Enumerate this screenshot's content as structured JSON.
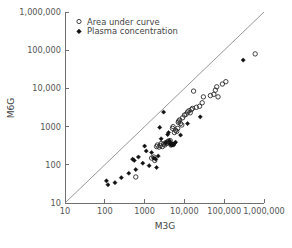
{
  "chart_data": {
    "type": "scatter",
    "title": "",
    "xlabel": "M3G",
    "ylabel": "M6G",
    "xscale": "log",
    "yscale": "log",
    "xlim": [
      10,
      1000000
    ],
    "ylim": [
      10,
      1000000
    ],
    "xticks": [
      10,
      100,
      1000,
      10000,
      100000,
      1000000
    ],
    "yticks": [
      10,
      100,
      1000,
      10000,
      100000,
      1000000
    ],
    "xtick_labels": [
      "10",
      "100",
      "1000",
      "10,000",
      "100,000",
      "1,000,000"
    ],
    "ytick_labels": [
      "10",
      "100",
      "1000",
      "10,000",
      "100,000",
      "1,000,000"
    ],
    "grid": false,
    "legend_position": "top-left",
    "annotations": [
      {
        "name": "identity-line",
        "type": "line",
        "from": [
          10,
          10
        ],
        "to": [
          1000000,
          1000000
        ],
        "label": "line of identity"
      }
    ],
    "series": [
      {
        "name": "Area under curve",
        "marker": "open-circle",
        "color": "#2b2b2b",
        "points": [
          [
            600,
            48
          ],
          [
            1500,
            150
          ],
          [
            1700,
            160
          ],
          [
            1800,
            130
          ],
          [
            2000,
            300
          ],
          [
            2100,
            330
          ],
          [
            2300,
            290
          ],
          [
            2500,
            320
          ],
          [
            2600,
            360
          ],
          [
            2800,
            300
          ],
          [
            3000,
            350
          ],
          [
            3200,
            330
          ],
          [
            3400,
            380
          ],
          [
            3600,
            360
          ],
          [
            3800,
            400
          ],
          [
            4000,
            420
          ],
          [
            4200,
            390
          ],
          [
            4400,
            430
          ],
          [
            4600,
            330
          ],
          [
            4800,
            340
          ],
          [
            5000,
            900
          ],
          [
            5200,
            1000
          ],
          [
            5600,
            700
          ],
          [
            6000,
            800
          ],
          [
            6400,
            750
          ],
          [
            6800,
            900
          ],
          [
            7000,
            1300
          ],
          [
            7200,
            1400
          ],
          [
            7600,
            1500
          ],
          [
            8000,
            1200
          ],
          [
            8600,
            1100
          ],
          [
            9000,
            1700
          ],
          [
            10000,
            2000
          ],
          [
            11000,
            2100
          ],
          [
            12000,
            2400
          ],
          [
            13000,
            2600
          ],
          [
            14000,
            2300
          ],
          [
            15000,
            2800
          ],
          [
            16000,
            3000
          ],
          [
            17000,
            8500
          ],
          [
            20000,
            3200
          ],
          [
            24000,
            3400
          ],
          [
            28000,
            4200
          ],
          [
            30000,
            6000
          ],
          [
            45000,
            6500
          ],
          [
            55000,
            7000
          ],
          [
            60000,
            9000
          ],
          [
            65000,
            11000
          ],
          [
            70000,
            6000
          ],
          [
            90000,
            13000
          ],
          [
            110000,
            15000
          ],
          [
            600000,
            80000
          ]
        ]
      },
      {
        "name": "Plasma concentration",
        "marker": "filled-diamond",
        "color": "#111111",
        "points": [
          [
            110,
            38
          ],
          [
            120,
            30
          ],
          [
            180,
            34
          ],
          [
            260,
            46
          ],
          [
            400,
            60
          ],
          [
            500,
            140
          ],
          [
            550,
            130
          ],
          [
            600,
            75
          ],
          [
            700,
            160
          ],
          [
            900,
            110
          ],
          [
            1000,
            310
          ],
          [
            1100,
            230
          ],
          [
            1300,
            95
          ],
          [
            1500,
            210
          ],
          [
            1700,
            150
          ],
          [
            1900,
            140
          ],
          [
            2000,
            85
          ],
          [
            2200,
            170
          ],
          [
            2400,
            950
          ],
          [
            2600,
            480
          ],
          [
            3000,
            2400
          ],
          [
            3400,
            380
          ],
          [
            3800,
            620
          ],
          [
            4000,
            700
          ],
          [
            4200,
            420
          ],
          [
            4400,
            350
          ],
          [
            4600,
            360
          ],
          [
            4800,
            330
          ],
          [
            5000,
            340
          ],
          [
            5200,
            350
          ],
          [
            5400,
            330
          ],
          [
            5600,
            360
          ],
          [
            6000,
            390
          ],
          [
            8000,
            600
          ],
          [
            12000,
            1200
          ],
          [
            25000,
            1800
          ],
          [
            300000,
            55000
          ]
        ]
      }
    ]
  },
  "legend": {
    "entries": [
      {
        "label": "Area under curve",
        "marker": "open-circle"
      },
      {
        "label": "Plasma concentration",
        "marker": "filled-diamond"
      }
    ]
  },
  "axes": {
    "x_title": "M3G",
    "y_title": "M6G"
  },
  "caption": {
    "text": ""
  }
}
